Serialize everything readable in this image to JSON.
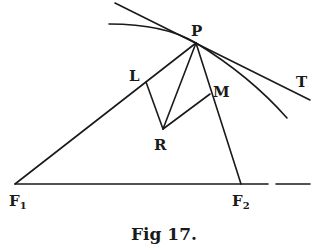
{
  "figure": {
    "caption": "Fig 17.",
    "points": {
      "P": {
        "label": "P",
        "x": 196,
        "y": 43
      },
      "L": {
        "label": "L",
        "x": 146,
        "y": 82
      },
      "M": {
        "label": "M",
        "x": 210,
        "y": 94
      },
      "R": {
        "label": "R",
        "x": 163,
        "y": 129
      },
      "F1": {
        "label": "F",
        "sub": "1",
        "x": 15,
        "y": 184
      },
      "F2": {
        "label": "F",
        "sub": "2",
        "x": 241,
        "y": 184
      },
      "T": {
        "label": "T"
      }
    },
    "segments": [
      "P-F1",
      "P-F2",
      "P-R",
      "L-R",
      "R-M",
      "F1-F2 (extended)"
    ],
    "curves": [
      "tangent line through P toward T",
      "curve (ellipse arc) through P"
    ]
  }
}
